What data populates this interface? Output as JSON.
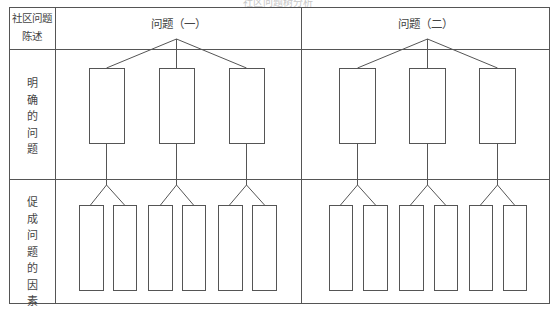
{
  "title": "社区问题树分析",
  "row_headers": {
    "header": {
      "line1": "社区问题",
      "line2": "陈述"
    },
    "identified": [
      "明",
      "确",
      "的",
      "问",
      "题"
    ],
    "factors": [
      "促",
      "成",
      "问",
      "题",
      "的",
      "因",
      "素"
    ]
  },
  "columns": [
    {
      "label": "问题（一）"
    },
    {
      "label": "问题（二）"
    }
  ],
  "diagram": {
    "line_color": "#555555",
    "border_color": "#444444",
    "problems_per_column": 3,
    "factors_per_problem": 2
  }
}
